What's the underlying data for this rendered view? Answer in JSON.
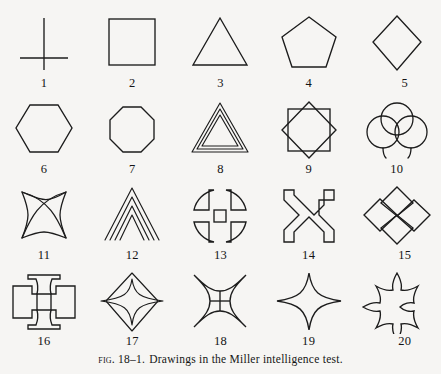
{
  "figure": {
    "caption_label": "Fig.",
    "caption_number": "18–1.",
    "caption_text": "Drawings in the Miller intelligence test.",
    "caption_full": "Fig. 18–1. Drawings in the Miller intelligence test.",
    "background_color": "#f6f5f3",
    "ink_color": "#1c1c1c",
    "columns": 5,
    "rows": 4,
    "item_count": 20
  },
  "items": [
    {
      "number": "1",
      "name": "cross-line-figure",
      "description": "vertical line crossed low by a shorter horizontal line"
    },
    {
      "number": "2",
      "name": "square",
      "description": "square"
    },
    {
      "number": "3",
      "name": "triangle",
      "description": "equilateral triangle"
    },
    {
      "number": "4",
      "name": "pentagon",
      "description": "regular pentagon"
    },
    {
      "number": "5",
      "name": "diamond",
      "description": "tall diamond / rhombus"
    },
    {
      "number": "6",
      "name": "hexagon",
      "description": "regular hexagon"
    },
    {
      "number": "7",
      "name": "octagon",
      "description": "regular octagon"
    },
    {
      "number": "8",
      "name": "nested-triangles",
      "description": "three nested triangles"
    },
    {
      "number": "9",
      "name": "overlapping-squares-star",
      "description": "two squares rotated 45 degrees forming an eight-pointed star"
    },
    {
      "number": "10",
      "name": "three-overlapping-circles",
      "description": "three overlapping circles with tails"
    },
    {
      "number": "11",
      "name": "crossed-arcs-star",
      "description": "two crossed lens arcs inside a concave four-point star"
    },
    {
      "number": "12",
      "name": "nested-chevrons",
      "description": "four nested chevrons / tent lines"
    },
    {
      "number": "13",
      "name": "circle-with-grid-cross",
      "description": "circle divided by a wide double-line cross"
    },
    {
      "number": "14",
      "name": "x-with-square-ends",
      "description": "outlined diagonal X with square terminals"
    },
    {
      "number": "15",
      "name": "four-diamond-cluster",
      "description": "four diamonds arranged as a cross"
    },
    {
      "number": "16",
      "name": "cross-pattee-flared",
      "description": "cross with flared concave arm ends"
    },
    {
      "number": "17",
      "name": "star-over-diamond",
      "description": "four-pointed star overlapping a diamond"
    },
    {
      "number": "18",
      "name": "quartered-concave-star",
      "description": "concave four-pointed star divided into quadrants"
    },
    {
      "number": "19",
      "name": "concave-four-point-star",
      "description": "concave four-pointed star"
    },
    {
      "number": "20",
      "name": "cross-pattee-concave",
      "description": "cross pattée with concave flared ends"
    }
  ]
}
